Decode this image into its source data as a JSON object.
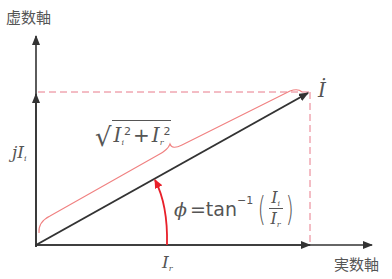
{
  "diagram": {
    "imaginary_axis_label": "虚数軸",
    "real_axis_label": "実数軸",
    "vector_label": "İ",
    "imag_component_label": "jI",
    "imag_component_sub": "i",
    "real_component_label": "I",
    "real_component_sub": "r",
    "magnitude_formula": {
      "sqrt": "√",
      "term1": "I",
      "term1_sub": "i",
      "term1_sup": "2",
      "plus": "+",
      "term2": "I",
      "term2_sub": "r",
      "term2_sup": "2"
    },
    "angle_formula": {
      "phi": "ϕ",
      "equals_tan": "=tan",
      "inverse": "−1",
      "numerator": "I",
      "numerator_sub": "i",
      "denominator": "I",
      "denominator_sub": "r",
      "paren_open": "(",
      "paren_close": ")"
    },
    "colors": {
      "axis": "#333333",
      "accent_red": "#e8202a",
      "dashed_red": "#e87a8a",
      "brace_red": "#f08080",
      "text": "#555555"
    }
  }
}
